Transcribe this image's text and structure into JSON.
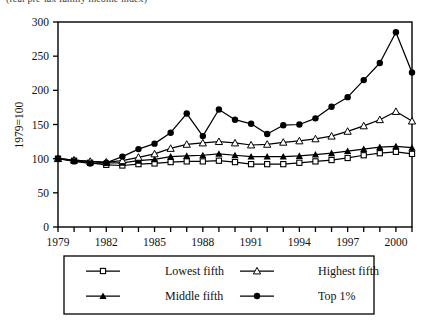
{
  "top_caption": "(real pre-tax family income index)",
  "chart_data": {
    "type": "line",
    "title": "",
    "xlabel": "",
    "ylabel": "1979=100",
    "xlim": [
      1979,
      2001
    ],
    "ylim": [
      0,
      300
    ],
    "ytick_step": 50,
    "yticks": [
      0,
      50,
      100,
      150,
      200,
      250,
      300
    ],
    "xticks": [
      1979,
      1980,
      1981,
      1982,
      1983,
      1984,
      1985,
      1986,
      1987,
      1988,
      1989,
      1990,
      1991,
      1992,
      1993,
      1994,
      1995,
      1996,
      1997,
      1998,
      1999,
      2000,
      2001
    ],
    "xtick_labels": [
      "1979",
      "",
      "",
      "1982",
      "",
      "",
      "1985",
      "",
      "",
      "1988",
      "",
      "",
      "1991",
      "",
      "",
      "1994",
      "",
      "",
      "1997",
      "",
      "",
      "2000",
      ""
    ],
    "grid": false,
    "legend_position": "below",
    "x": [
      1979,
      1980,
      1981,
      1982,
      1983,
      1984,
      1985,
      1986,
      1987,
      1988,
      1989,
      1990,
      1991,
      1992,
      1993,
      1994,
      1995,
      1996,
      1997,
      1998,
      1999,
      2000,
      2001
    ],
    "series": [
      {
        "name": "Lowest fifth",
        "marker": "open-square",
        "values": [
          100,
          97,
          94,
          91,
          90,
          92,
          93,
          95,
          96,
          96,
          97,
          95,
          92,
          92,
          92,
          94,
          96,
          98,
          101,
          105,
          108,
          110,
          107
        ]
      },
      {
        "name": "Middle fifth",
        "marker": "filled-triangle",
        "values": [
          100,
          98,
          96,
          94,
          94,
          97,
          99,
          103,
          104,
          105,
          107,
          105,
          103,
          103,
          103,
          104,
          106,
          108,
          111,
          114,
          117,
          118,
          116
        ]
      },
      {
        "name": "Highest fifth",
        "marker": "open-triangle",
        "values": [
          100,
          98,
          96,
          95,
          97,
          102,
          107,
          115,
          121,
          123,
          125,
          123,
          120,
          121,
          124,
          126,
          129,
          133,
          140,
          148,
          157,
          169,
          155
        ]
      },
      {
        "name": "Top 1%",
        "marker": "filled-circle",
        "values": [
          100,
          96,
          93,
          94,
          103,
          114,
          122,
          138,
          166,
          133,
          172,
          157,
          151,
          136,
          149,
          150,
          159,
          176,
          190,
          215,
          240,
          285,
          226
        ]
      }
    ]
  },
  "legend": {
    "items": [
      {
        "label": "Lowest fifth",
        "marker": "open-square"
      },
      {
        "label": "Highest fifth",
        "marker": "open-triangle"
      },
      {
        "label": "Middle fifth",
        "marker": "filled-triangle"
      },
      {
        "label": "Top 1%",
        "marker": "filled-circle"
      }
    ]
  },
  "colors": {
    "line": "#000000",
    "axis": "#000000",
    "background": "#ffffff"
  }
}
